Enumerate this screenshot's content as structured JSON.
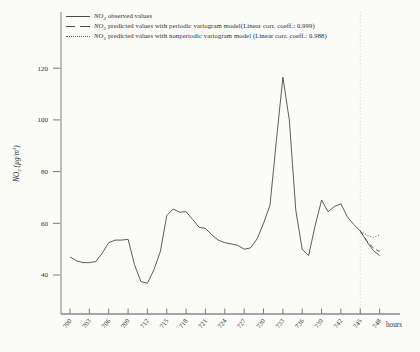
{
  "figure": {
    "background": "#fbfbf9",
    "line_color": "#4a4a4a",
    "axis_color": "#8a8a8a",
    "text_color": "#333333",
    "refline_color": "#c6c6c6"
  },
  "legend": {
    "items": [
      {
        "marker": "solid-line",
        "formula": "NO",
        "formula_sub": "2",
        "text": " observed values"
      },
      {
        "marker": "dashed-line",
        "formula": "NO",
        "formula_sub": "2",
        "text": " predicted values with periodic variogram model(Linear corr. coeff.: 0.999)"
      },
      {
        "marker": "dotted-line",
        "formula": "NO",
        "formula_sub": "2",
        "text": " predicted values with nonperiodic variogram model (Linear corr. coeff.: 0.988)"
      }
    ]
  },
  "chart_data": {
    "type": "line",
    "title": "",
    "xlabel": "hours",
    "ylabel": "NO2 (µg/m3)",
    "ylabel_parts": {
      "prefix": "NO",
      "sub": "2",
      "mid": " (µg/m",
      "sup": "3",
      "end": ")"
    },
    "x_ticks": [
      700,
      703,
      706,
      709,
      712,
      715,
      718,
      721,
      724,
      727,
      730,
      733,
      736,
      739,
      742,
      745,
      748
    ],
    "y_ticks": [
      40,
      60,
      80,
      100,
      120
    ],
    "xlim": [
      698.5,
      751
    ],
    "ylim": [
      25,
      141
    ],
    "grid": false,
    "legend_position": "top-left",
    "reference_line": {
      "x": 745,
      "style": "dotted"
    },
    "series": [
      {
        "name": "NO2 observed values",
        "style": "solid",
        "x": [
          700,
          701,
          702,
          703,
          704,
          705,
          706,
          707,
          708,
          709,
          710,
          711,
          712,
          713,
          714,
          715,
          716,
          717,
          718,
          719,
          720,
          721,
          722,
          723,
          724,
          725,
          726,
          727,
          728,
          729,
          730,
          731,
          732,
          733,
          734,
          735,
          736,
          737,
          738,
          739,
          740,
          741,
          742,
          743,
          744,
          745,
          746,
          747,
          748
        ],
        "values": [
          47,
          45.5,
          44.8,
          44.8,
          45.2,
          48.5,
          52.5,
          53.5,
          53.5,
          53.8,
          44,
          37.5,
          36.8,
          42,
          49,
          63,
          65.5,
          64.3,
          64.5,
          61.5,
          58.5,
          58,
          55.5,
          53.5,
          52.5,
          52,
          51.5,
          50,
          50.5,
          54,
          60,
          67,
          92,
          116.5,
          100,
          65,
          50,
          47.5,
          59,
          69,
          64.5,
          66.5,
          67.5,
          62.5,
          59.5,
          57,
          53,
          49.5,
          47.5
        ]
      },
      {
        "name": "NO2 predicted values with periodic variogram model",
        "style": "dashed",
        "linear_corr_coeff": 0.999,
        "x": [
          745,
          746,
          747,
          748
        ],
        "values": [
          57,
          53.3,
          50.5,
          49
        ]
      },
      {
        "name": "NO2 predicted values with nonperiodic variogram model",
        "style": "dotted",
        "linear_corr_coeff": 0.988,
        "x": [
          745,
          746,
          747,
          748
        ],
        "values": [
          57,
          55.5,
          54.5,
          55.5
        ]
      }
    ]
  }
}
